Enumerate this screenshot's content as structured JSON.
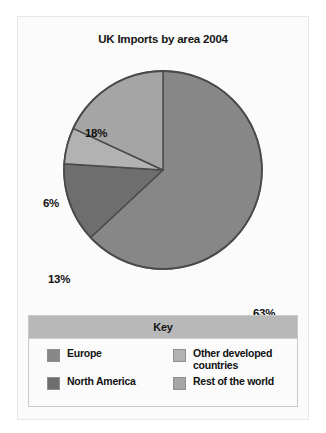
{
  "chart_data": {
    "type": "pie",
    "title": "UK Imports by area 2004",
    "categories": [
      "Europe",
      "North America",
      "Other developed countries",
      "Rest of the world"
    ],
    "values": [
      63,
      13,
      6,
      18
    ],
    "value_labels": [
      "63%",
      "13%",
      "6%",
      "18%"
    ],
    "unit": "%",
    "legend_position": "bottom",
    "legend_title": "Key",
    "start_angle_deg": 0,
    "direction": "clockwise",
    "colors": [
      "#878787",
      "#6e6e6e",
      "#b2b2b2",
      "#a5a5a5"
    ],
    "slice_outline_color": "#4a4a4a"
  },
  "chart": {
    "title": "UK Imports by area 2004",
    "labels": {
      "europe": "63%",
      "north_america": "13%",
      "other_developed": "6%",
      "rest_of_world": "18%"
    }
  },
  "legend": {
    "title": "Key",
    "items": [
      {
        "label": "Europe",
        "color": "#878787"
      },
      {
        "label": "Other developed\ncountries",
        "color": "#b2b2b2"
      },
      {
        "label": "North America",
        "color": "#6e6e6e"
      },
      {
        "label": "Rest of the world",
        "color": "#a5a5a5"
      }
    ]
  }
}
